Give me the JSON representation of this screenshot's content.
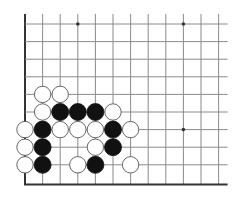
{
  "diagram": {
    "type": "go-board-fragment",
    "grid": {
      "origin_x": 25,
      "origin_y": 24,
      "spacing": 17.6,
      "columns": 12,
      "rows": 10,
      "line_extend_top": 10,
      "line_extend_right": 9,
      "left_edge_thick": true,
      "bottom_edge_thick": true
    },
    "colors": {
      "background": "#ffffff",
      "grid_line": "#8a8a8a",
      "edge_line": "#333333",
      "black_stone": "#111111",
      "white_stone": "#ffffff",
      "white_stone_outline": "#555555"
    },
    "star_points": [
      {
        "col": 3,
        "row": 0
      },
      {
        "col": 9,
        "row": 0
      },
      {
        "col": 9,
        "row": 6
      }
    ],
    "stones": [
      {
        "color": "white",
        "col": 1,
        "row": 4
      },
      {
        "color": "white",
        "col": 2,
        "row": 4
      },
      {
        "color": "white",
        "col": 1,
        "row": 5
      },
      {
        "color": "black",
        "col": 2,
        "row": 5
      },
      {
        "color": "black",
        "col": 3,
        "row": 5
      },
      {
        "color": "black",
        "col": 4,
        "row": 5
      },
      {
        "color": "white",
        "col": 5,
        "row": 5
      },
      {
        "color": "white",
        "col": 0,
        "row": 6
      },
      {
        "color": "black",
        "col": 1,
        "row": 6
      },
      {
        "color": "white",
        "col": 2,
        "row": 6
      },
      {
        "color": "white",
        "col": 3,
        "row": 6
      },
      {
        "color": "white",
        "col": 4,
        "row": 6
      },
      {
        "color": "black",
        "col": 5,
        "row": 6
      },
      {
        "color": "white",
        "col": 6,
        "row": 6
      },
      {
        "color": "white",
        "col": 0,
        "row": 7
      },
      {
        "color": "black",
        "col": 1,
        "row": 7
      },
      {
        "color": "white",
        "col": 4,
        "row": 7
      },
      {
        "color": "black",
        "col": 5,
        "row": 7
      },
      {
        "color": "white",
        "col": 0,
        "row": 8
      },
      {
        "color": "black",
        "col": 1,
        "row": 8
      },
      {
        "color": "white",
        "col": 3,
        "row": 8
      },
      {
        "color": "black",
        "col": 4,
        "row": 8
      },
      {
        "color": "white",
        "col": 6,
        "row": 8
      }
    ]
  }
}
